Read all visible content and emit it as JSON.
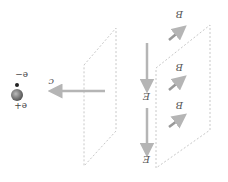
{
  "diagram": {
    "labels": {
      "speed": "c",
      "electron": "e−",
      "proton": "e+",
      "electric_field": "E",
      "magnetic_field": "B"
    },
    "field_vectors": {
      "E": [
        "E",
        "E"
      ],
      "B": [
        "B",
        "B",
        "B"
      ]
    },
    "colors": {
      "arrow_gray": "#b5b5b5",
      "dash_gray": "#c8c8c8",
      "text": "#555555",
      "particle": "#666666"
    }
  }
}
